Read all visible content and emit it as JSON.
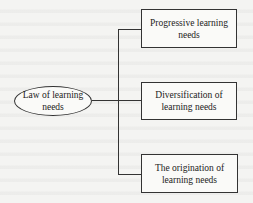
{
  "diagram": {
    "root": {
      "label": "Law of learning needs"
    },
    "children": [
      {
        "label": "Progressive learning needs"
      },
      {
        "label": "Diversification of learning needs"
      },
      {
        "label": "The origination of learning needs"
      }
    ],
    "colors": {
      "stroke": "#333333",
      "background": "#f4f4f2"
    }
  }
}
